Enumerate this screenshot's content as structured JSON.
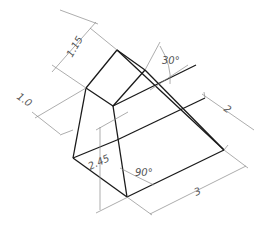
{
  "drawing": {
    "type": "isometric-prism",
    "object_color": "#1a1a1a",
    "dimension_color": "#8a8a8a",
    "labels": {
      "top_height": "1.15",
      "left_offset": "1.0",
      "ridge_angle": "30°",
      "depth": "2",
      "height": "2.45",
      "corner_angle": "90°",
      "width": "3"
    }
  }
}
